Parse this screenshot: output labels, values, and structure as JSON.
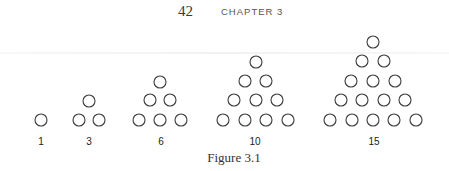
{
  "header": {
    "page_number": "42",
    "chapter": "CHAPTER 3"
  },
  "figure": {
    "caption": "Figure 3.1",
    "circle_radius": 6,
    "stroke_color": "#3a3a3a",
    "triangles": [
      {
        "label": "1",
        "label_x": 41,
        "circles": [
          [
            41,
            120
          ]
        ]
      },
      {
        "label": "3",
        "label_x": 89,
        "circles": [
          [
            89,
            101
          ],
          [
            79,
            120
          ],
          [
            99,
            120
          ]
        ]
      },
      {
        "label": "6",
        "label_x": 161,
        "circles": [
          [
            160,
            82
          ],
          [
            150,
            100
          ],
          [
            170,
            100
          ],
          [
            139,
            120
          ],
          [
            160,
            120
          ],
          [
            181,
            120
          ]
        ]
      },
      {
        "label": "10",
        "label_x": 255,
        "circles": [
          [
            256,
            62
          ],
          [
            245,
            81
          ],
          [
            266,
            81
          ],
          [
            234,
            100
          ],
          [
            256,
            100
          ],
          [
            277,
            100
          ],
          [
            223,
            120
          ],
          [
            245,
            120
          ],
          [
            266,
            120
          ],
          [
            288,
            120
          ]
        ]
      },
      {
        "label": "15",
        "label_x": 374,
        "circles": [
          [
            373,
            42
          ],
          [
            362,
            61
          ],
          [
            384,
            61
          ],
          [
            351,
            81
          ],
          [
            373,
            81
          ],
          [
            395,
            81
          ],
          [
            341,
            100
          ],
          [
            362,
            100
          ],
          [
            384,
            100
          ],
          [
            405,
            100
          ],
          [
            330,
            120
          ],
          [
            352,
            120
          ],
          [
            373,
            120
          ],
          [
            394,
            120
          ],
          [
            416,
            120
          ]
        ]
      }
    ]
  }
}
